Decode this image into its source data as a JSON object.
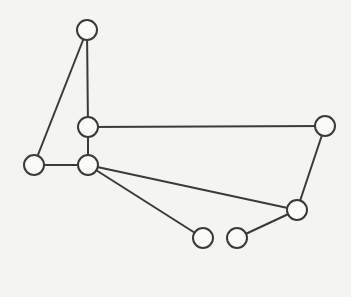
{
  "diagram": {
    "type": "graph",
    "directed": false,
    "background": "#f4f4f2",
    "stroke_color": "#3a3a3a",
    "node_radius": 10,
    "nodes": [
      {
        "id": "n_top",
        "x": 87,
        "y": 30
      },
      {
        "id": "n_mid_upper",
        "x": 88,
        "y": 127
      },
      {
        "id": "n_lower_mid",
        "x": 88,
        "y": 165
      },
      {
        "id": "n_left",
        "x": 34,
        "y": 165
      },
      {
        "id": "n_right",
        "x": 325,
        "y": 126
      },
      {
        "id": "n_lower_right",
        "x": 297,
        "y": 210
      },
      {
        "id": "n_bottom_left",
        "x": 203,
        "y": 238
      },
      {
        "id": "n_bottom_right",
        "x": 237,
        "y": 238
      }
    ],
    "edges": [
      {
        "from": "n_top",
        "to": "n_mid_upper"
      },
      {
        "from": "n_top",
        "to": "n_left"
      },
      {
        "from": "n_mid_upper",
        "to": "n_lower_mid"
      },
      {
        "from": "n_mid_upper",
        "to": "n_right"
      },
      {
        "from": "n_left",
        "to": "n_lower_mid"
      },
      {
        "from": "n_lower_mid",
        "to": "n_lower_right"
      },
      {
        "from": "n_lower_mid",
        "to": "n_bottom_left"
      },
      {
        "from": "n_right",
        "to": "n_lower_right"
      },
      {
        "from": "n_lower_right",
        "to": "n_bottom_right"
      }
    ]
  }
}
